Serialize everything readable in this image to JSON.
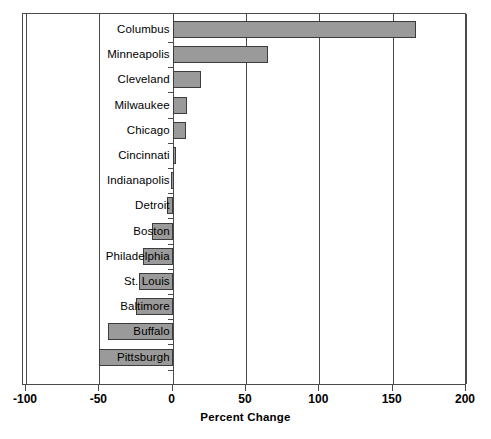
{
  "chart_data": {
    "type": "bar",
    "orientation": "horizontal",
    "title": "",
    "xlabel": "Percent Change",
    "ylabel": "",
    "xlim": [
      -100,
      200
    ],
    "xticks": [
      -100,
      -50,
      0,
      50,
      100,
      150,
      200
    ],
    "xtick_labels": [
      "-100",
      "-50",
      "0",
      "50",
      "100",
      "150",
      "200"
    ],
    "grid": "vertical gridlines at each x tick",
    "legend": "none",
    "categories": [
      "Columbus",
      "Minneapolis",
      "Cleveland",
      "Milwaukee",
      "Chicago",
      "Cincinnati",
      "Indianapolis",
      "Detroit",
      "Boston",
      "Philadelphia",
      "St. Louis",
      "Baltimore",
      "Buffalo",
      "Pittsburgh"
    ],
    "values": [
      166,
      65,
      19,
      10,
      9,
      2,
      -1,
      -4,
      -14,
      -20,
      -23,
      -25,
      -44,
      -50
    ],
    "bar_fill_color": "#9a9a9a",
    "bar_edge_color": "#3c3c3c",
    "axis_color": "#4a4a4a",
    "background_color": "#ffffff"
  }
}
